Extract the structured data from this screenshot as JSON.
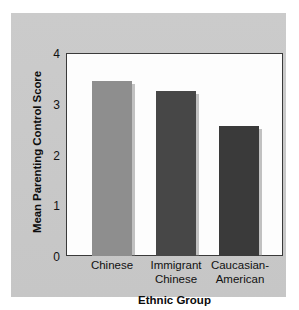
{
  "chart_data": {
    "type": "bar",
    "title": "",
    "subtitle": "",
    "xlabel": "Ethnic Group",
    "ylabel": "Mean Parenting Control Score",
    "categories": [
      "Chinese",
      "Immigrant Chinese",
      "Caucasian-American"
    ],
    "category_lines": [
      [
        "Chinese"
      ],
      [
        "Immigrant",
        "Chinese"
      ],
      [
        "Caucasian-",
        "American"
      ]
    ],
    "values": [
      3.45,
      3.25,
      2.56
    ],
    "bar_colors": [
      "#8e8e8e",
      "#474747",
      "#3a3a3a"
    ],
    "ylim": [
      0,
      4
    ],
    "yticks": [
      "0",
      "1",
      "2",
      "3",
      "4"
    ],
    "ytick_values": [
      0,
      1,
      2,
      3,
      4
    ],
    "grid": false,
    "legend": false,
    "legend_position": "none",
    "axis_color": "#3a3a3a",
    "plot_background": "#fdfdfd",
    "figure_background": "#c9c9c9"
  }
}
